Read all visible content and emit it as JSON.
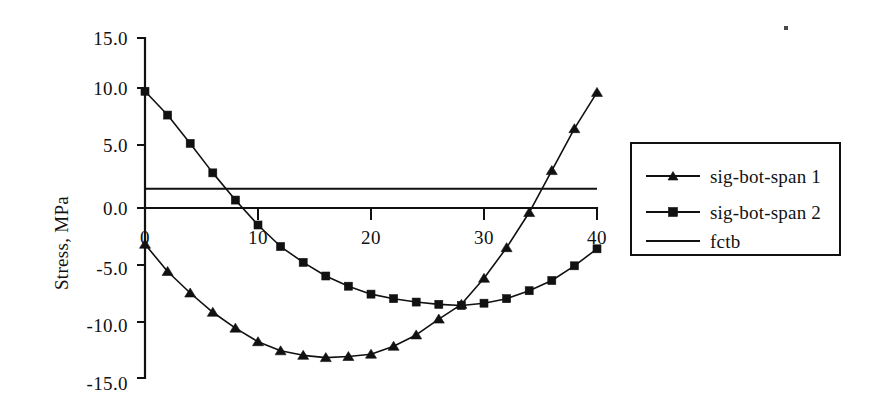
{
  "chart_data": {
    "type": "line",
    "title": "",
    "subtitle": "",
    "xlabel": "",
    "ylabel": "Stress, MPa",
    "xlim": [
      0,
      40
    ],
    "ylim": [
      -15.0,
      15.0
    ],
    "xticks": [
      0,
      10,
      20,
      30,
      40
    ],
    "xtick_labels": [
      "0",
      "10",
      "20",
      "30",
      "40"
    ],
    "yticks": [
      15.0,
      10.0,
      5.0,
      0.0,
      -5.0,
      -10.0,
      -15.0
    ],
    "ytick_labels": [
      "15.0",
      "10.0",
      "5.0",
      "0.0",
      "-5.0",
      "-10.0",
      "-15.0"
    ],
    "grid": false,
    "legend_position": "right",
    "x": [
      0,
      2,
      4,
      6,
      8,
      10,
      12,
      14,
      16,
      18,
      20,
      22,
      24,
      26,
      28,
      30,
      32,
      34,
      36,
      38,
      40
    ],
    "series": [
      {
        "name": "sig-bot-span 1",
        "marker": "triangle",
        "values": [
          -3.2,
          -5.6,
          -7.5,
          -9.2,
          -10.6,
          -11.8,
          -12.6,
          -13.0,
          -13.2,
          -13.1,
          -12.9,
          -12.2,
          -11.2,
          -9.8,
          -8.5,
          -6.2,
          -3.5,
          -0.4,
          3.3,
          7.0,
          10.2
        ]
      },
      {
        "name": "sig-bot-span 2",
        "marker": "square",
        "values": [
          10.3,
          8.2,
          5.7,
          3.1,
          0.7,
          -1.5,
          -3.4,
          -4.8,
          -6.0,
          -6.9,
          -7.6,
          -8.0,
          -8.3,
          -8.5,
          -8.6,
          -8.4,
          -8.0,
          -7.3,
          -6.4,
          -5.1,
          -3.6
        ]
      }
    ],
    "reference_lines": [
      {
        "name": "fctb",
        "value": 1.7,
        "marker": "none"
      }
    ],
    "legend_entries": [
      {
        "label": "sig-bot-span 1",
        "marker": "triangle"
      },
      {
        "label": "sig-bot-span 2",
        "marker": "square"
      },
      {
        "label": "fctb",
        "marker": "none"
      }
    ]
  }
}
